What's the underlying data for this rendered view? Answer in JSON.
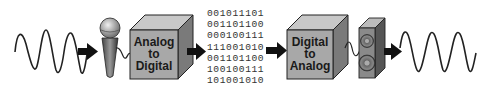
{
  "diagram": {
    "stages": [
      {
        "id": "input-wave",
        "type": "analog-wave",
        "label": ""
      },
      {
        "id": "microphone",
        "type": "microphone",
        "label": ""
      },
      {
        "id": "adc",
        "type": "converter-box",
        "label_lines": [
          "Analog",
          "to",
          "Digital"
        ]
      },
      {
        "id": "binary",
        "type": "binary-data",
        "rows": [
          "001011101",
          "001101100",
          "000100111",
          "111001010",
          "001101100",
          "100100111",
          "101001010"
        ]
      },
      {
        "id": "dac",
        "type": "converter-box",
        "label_lines": [
          "Digital",
          "to",
          "Analog"
        ]
      },
      {
        "id": "speaker",
        "type": "speaker",
        "label": ""
      },
      {
        "id": "output-wave",
        "type": "analog-wave",
        "label": ""
      }
    ],
    "colors": {
      "box_front": "#a8a8a8",
      "box_top": "#c8c8c8",
      "box_side": "#7a7a7a",
      "outline": "#222222",
      "arrow": "#111111",
      "wave": "#222222"
    }
  }
}
